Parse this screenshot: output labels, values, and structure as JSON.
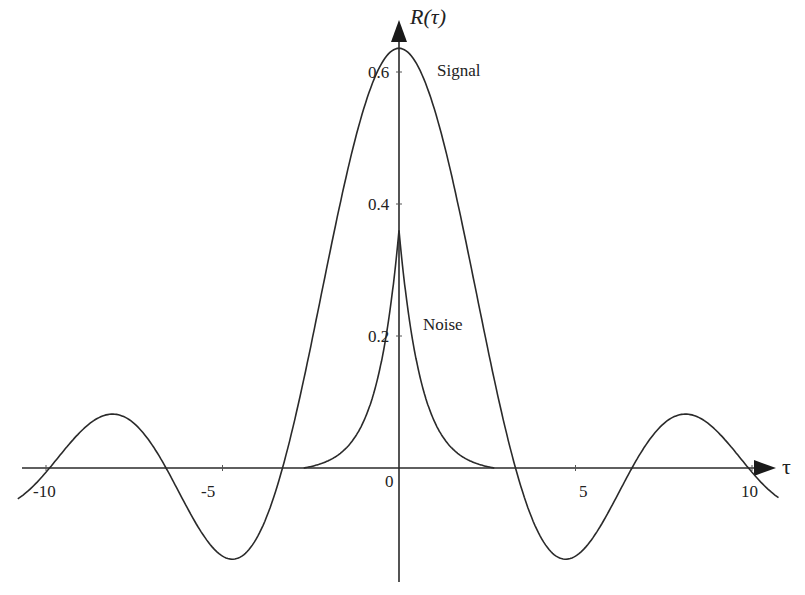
{
  "chart_data": {
    "type": "line",
    "title": "",
    "xlabel": "τ",
    "ylabel": "R(τ)",
    "xlim": [
      -10.5,
      10.5
    ],
    "ylim": [
      -0.2,
      0.68
    ],
    "x_ticks": [
      "-10",
      "-5",
      "0",
      "5",
      "10"
    ],
    "y_ticks": [
      "0.2",
      "0.4",
      "0.6"
    ],
    "grid": false,
    "legend": "inline labels",
    "series": [
      {
        "name": "Signal",
        "description": "sinc-shaped autocorrelation, peak 0.636 at τ=0",
        "x": [
          -11,
          -10,
          -9.6,
          -8,
          -6.5,
          -4.7,
          -3.3,
          -2,
          -1,
          0,
          1,
          2,
          3.3,
          4.7,
          6.5,
          8,
          9.6,
          10,
          11
        ],
        "values": [
          -0.04,
          -0.02,
          0.0,
          0.08,
          0.0,
          -0.138,
          0.0,
          0.33,
          0.55,
          0.636,
          0.55,
          0.33,
          0.0,
          -0.138,
          0.0,
          0.08,
          0.0,
          -0.02,
          -0.04
        ]
      },
      {
        "name": "Noise",
        "description": "exponential-cusp autocorrelation, peak 0.36 at τ=0",
        "x": [
          -2.7,
          -2,
          -1.5,
          -1,
          -0.5,
          0,
          0.5,
          1,
          1.5,
          2,
          2.7
        ],
        "values": [
          0.0,
          0.015,
          0.035,
          0.07,
          0.16,
          0.36,
          0.16,
          0.07,
          0.035,
          0.015,
          0.0
        ]
      }
    ],
    "annotations": [
      "Signal",
      "Noise"
    ]
  },
  "labels": {
    "y_axis": "R(τ)",
    "x_axis": "τ",
    "signal": "Signal",
    "noise": "Noise",
    "tick_0_6": "0.6",
    "tick_0_4": "0.4",
    "tick_0_2": "0.2",
    "tick_m10": "-10",
    "tick_m5": "-5",
    "tick_0": "0",
    "tick_5": "5",
    "tick_10": "10"
  },
  "style": {
    "line_color": "#2a2a2a",
    "background": "#ffffff"
  }
}
